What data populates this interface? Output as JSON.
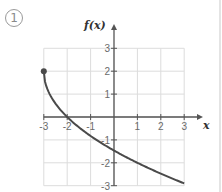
{
  "figure_number": "1",
  "chart_data": {
    "type": "line",
    "title": "",
    "xlabel": "x",
    "ylabel": "f(x)",
    "xlim": [
      -3,
      3
    ],
    "ylim": [
      -3,
      3
    ],
    "grid": true,
    "x_ticks": [
      "-3",
      "-2",
      "-1",
      "1",
      "2",
      "3"
    ],
    "y_ticks": [
      "3",
      "2",
      "1",
      "-1",
      "-2",
      "-3"
    ],
    "series": [
      {
        "name": "f(x)",
        "x": [
          -3,
          -2.75,
          -2.5,
          -2,
          -1.5,
          -1,
          0,
          1,
          2,
          3
        ],
        "y": [
          2,
          1.0,
          0.59,
          0,
          -0.45,
          -1.0,
          -1.46,
          -2,
          -2.47,
          -2.9
        ],
        "start_point": {
          "x": -3,
          "y": 2,
          "closed": true
        }
      }
    ],
    "legend": null
  },
  "colors": {
    "curve": "#4a4a4a",
    "grid": "#dcdcdc",
    "axis": "#555555"
  }
}
